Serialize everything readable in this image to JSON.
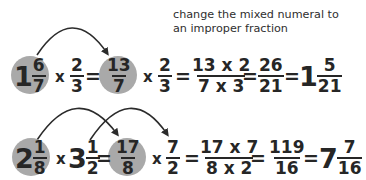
{
  "caption": {
    "line1": "change the mixed numeral to",
    "line2": "an improper fraction"
  },
  "row1": {
    "mixed1": {
      "whole": "1",
      "num": "6",
      "den": "7"
    },
    "op1": "x",
    "frac1": {
      "num": "2",
      "den": "3"
    },
    "eq1": "=",
    "improper": {
      "num": "13",
      "den": "7"
    },
    "op2": "x",
    "frac2": {
      "num": "2",
      "den": "3"
    },
    "eq2": "=",
    "product": {
      "num": "13 x 2",
      "den": "7 x 3"
    },
    "eq3": "=",
    "result": {
      "num": "26",
      "den": "21"
    },
    "eq4": "=",
    "answer": {
      "whole": "1",
      "num": "5",
      "den": "21"
    }
  },
  "row2": {
    "mixed1": {
      "whole": "2",
      "num": "1",
      "den": "8"
    },
    "op1": "x",
    "mixed2": {
      "whole": "3",
      "num": "1",
      "den": "2"
    },
    "eq1": "=",
    "improper": {
      "num": "17",
      "den": "8"
    },
    "op2": "x",
    "frac2": {
      "num": "7",
      "den": "2"
    },
    "eq2": "=",
    "product": {
      "num": "17 x 7",
      "den": "8 x 2"
    },
    "eq3": "=",
    "result": {
      "num": "119",
      "den": "16"
    },
    "eq4": "=",
    "answer": {
      "whole": "7",
      "num": "7",
      "den": "16"
    }
  },
  "colors": {
    "circle": "#a9a9a9",
    "text": "#262626",
    "arrow": "#2b2b2b"
  }
}
